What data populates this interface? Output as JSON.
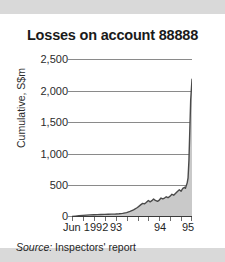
{
  "figure": {
    "title": "Losses on account 88888",
    "source_label": "Source:",
    "source_text": " Inspectors' report",
    "band_color": "#d9d9d9",
    "background_color": "#ffffff",
    "line_color": "#4a4a4a",
    "fill_color": "#c9c9c9",
    "grid_color": "#8a8a8a"
  },
  "chart_data": {
    "type": "area",
    "title": "Losses on account 88888",
    "subtitle": "",
    "xlabel": "",
    "ylabel": "Cumulative, S$m",
    "ylim": [
      0,
      2500
    ],
    "yticks": [
      0,
      500,
      1000,
      1500,
      2000,
      2500
    ],
    "ytick_labels": [
      "0",
      "500",
      "1,000",
      "1,500",
      "2,000",
      "2,500"
    ],
    "xlim": [
      1992.42,
      1995.17
    ],
    "xtick_labels": [
      "Jun 1992",
      "93",
      "94",
      "95"
    ],
    "xtick_positions": [
      1992.42,
      1993.0,
      1994.0,
      1995.0
    ],
    "minor_xticks": [
      1992.42,
      1992.67,
      1992.92,
      1993.17,
      1993.42,
      1993.67,
      1993.92,
      1994.17,
      1994.42,
      1994.67,
      1994.92,
      1995.17
    ],
    "grid": "horizontal",
    "legend": "none",
    "annotations": [],
    "series": [
      {
        "name": "Cumulative losses",
        "x": [
          1992.42,
          1992.5,
          1992.58,
          1992.67,
          1992.75,
          1992.83,
          1992.92,
          1993.0,
          1993.08,
          1993.17,
          1993.25,
          1993.33,
          1993.42,
          1993.5,
          1993.58,
          1993.67,
          1993.75,
          1993.83,
          1993.92,
          1994.0,
          1994.04,
          1994.08,
          1994.12,
          1994.17,
          1994.21,
          1994.25,
          1994.29,
          1994.33,
          1994.38,
          1994.42,
          1994.46,
          1994.5,
          1994.54,
          1994.58,
          1994.62,
          1994.67,
          1994.71,
          1994.75,
          1994.79,
          1994.83,
          1994.88,
          1994.92,
          1994.96,
          1995.0,
          1995.02,
          1995.04,
          1995.06,
          1995.08,
          1995.1,
          1995.12,
          1995.14,
          1995.17
        ],
        "values": [
          8,
          14,
          20,
          26,
          30,
          33,
          36,
          38,
          40,
          42,
          44,
          45,
          48,
          52,
          58,
          70,
          88,
          112,
          150,
          196,
          215,
          208,
          230,
          262,
          240,
          258,
          285,
          262,
          248,
          268,
          300,
          286,
          300,
          320,
          305,
          330,
          360,
          345,
          372,
          400,
          430,
          408,
          452,
          470,
          455,
          500,
          540,
          620,
          900,
          1380,
          1850,
          2180
        ]
      }
    ]
  },
  "y_axis": {
    "ticks": [
      {
        "label": "2,500",
        "value": 2500
      },
      {
        "label": "2,000",
        "value": 2000
      },
      {
        "label": "1,500",
        "value": 1500
      },
      {
        "label": "1,000",
        "value": 1000
      },
      {
        "label": "500",
        "value": 500
      },
      {
        "label": "0",
        "value": 0
      }
    ],
    "title": "Cumulative, S$m"
  },
  "x_axis": {
    "ticks": [
      {
        "label": "Jun 1992",
        "value": 1992.42
      },
      {
        "label": "93",
        "value": 1993.0
      },
      {
        "label": "94",
        "value": 1994.0
      },
      {
        "label": "95",
        "value": 1995.0
      }
    ]
  }
}
